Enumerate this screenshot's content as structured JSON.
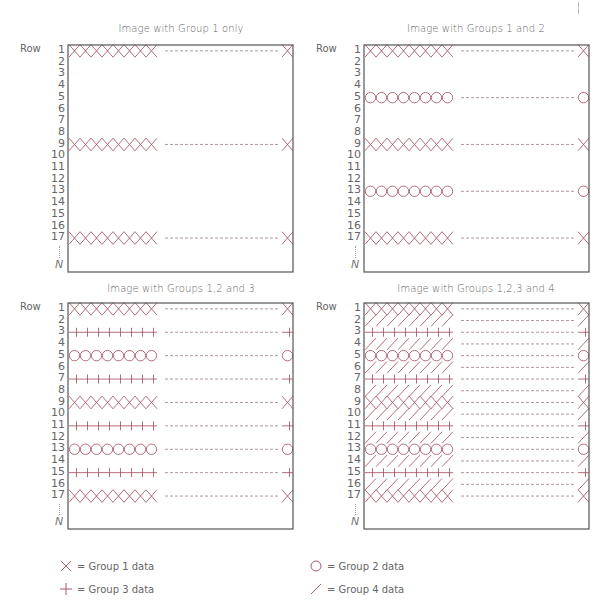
{
  "colors": {
    "symbol": "#a04a5a",
    "frame": "#555555",
    "dash": "#8a6a72",
    "text": "#666666"
  },
  "row_word": "Row",
  "row_labels": [
    "1",
    "2",
    "3",
    "4",
    "5",
    "6",
    "7",
    "8",
    "9",
    "10",
    "11",
    "12",
    "13",
    "14",
    "15",
    "16",
    "17"
  ],
  "n_label": "N",
  "panels": [
    {
      "id": "group1",
      "title": "Image with Group  1 only",
      "rows": {
        "1": [
          "x"
        ],
        "9": [
          "x"
        ],
        "17": [
          "x"
        ]
      },
      "group4_fill": false
    },
    {
      "id": "group12",
      "title": "Image with Groups  1 and 2",
      "rows": {
        "1": [
          "x"
        ],
        "5": [
          "o"
        ],
        "9": [
          "x"
        ],
        "13": [
          "o"
        ],
        "17": [
          "x"
        ]
      },
      "group4_fill": false
    },
    {
      "id": "group123",
      "title": "Image with Groups  1,2 and 3",
      "rows": {
        "1": [
          "x"
        ],
        "3": [
          "+"
        ],
        "5": [
          "o"
        ],
        "7": [
          "+"
        ],
        "9": [
          "x"
        ],
        "11": [
          "+"
        ],
        "13": [
          "o"
        ],
        "15": [
          "+"
        ],
        "17": [
          "x"
        ]
      },
      "group4_fill": false
    },
    {
      "id": "group1234",
      "title": "Image with Groups  1,2,3 and 4",
      "rows": {
        "1": [
          "x"
        ],
        "3": [
          "+"
        ],
        "5": [
          "o"
        ],
        "7": [
          "+"
        ],
        "9": [
          "x"
        ],
        "11": [
          "+"
        ],
        "13": [
          "o"
        ],
        "15": [
          "+"
        ],
        "17": [
          "x"
        ]
      },
      "group4_fill": true
    }
  ],
  "legend": [
    {
      "symbol": "x",
      "label": "= Group 1 data"
    },
    {
      "symbol": "o",
      "label": "= Group 2 data"
    },
    {
      "symbol": "+",
      "label": "= Group 3 data"
    },
    {
      "symbol": "/",
      "label": "= Group 4 data"
    }
  ]
}
